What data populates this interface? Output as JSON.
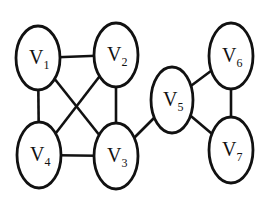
{
  "graph": {
    "type": "undirected",
    "colors": {
      "stroke": "#111111",
      "fill": "#ffffff",
      "background": "#ffffff"
    },
    "nodes": [
      {
        "id": "V1",
        "letter": "V",
        "sub": "1",
        "cx": 38,
        "cy": 58,
        "rx": 22,
        "ry": 32
      },
      {
        "id": "V2",
        "letter": "V",
        "sub": "2",
        "cx": 116,
        "cy": 55,
        "rx": 22,
        "ry": 32
      },
      {
        "id": "V3",
        "letter": "V",
        "sub": "3",
        "cx": 116,
        "cy": 156,
        "rx": 22,
        "ry": 33
      },
      {
        "id": "V4",
        "letter": "V",
        "sub": "4",
        "cx": 39,
        "cy": 155,
        "rx": 22,
        "ry": 33
      },
      {
        "id": "V5",
        "letter": "V",
        "sub": "5",
        "cx": 172,
        "cy": 100,
        "rx": 21,
        "ry": 33
      },
      {
        "id": "V6",
        "letter": "V",
        "sub": "6",
        "cx": 231,
        "cy": 56,
        "rx": 22,
        "ry": 33
      },
      {
        "id": "V7",
        "letter": "V",
        "sub": "7",
        "cx": 231,
        "cy": 150,
        "rx": 22,
        "ry": 33
      }
    ],
    "edges": [
      {
        "from": "V1",
        "to": "V2"
      },
      {
        "from": "V1",
        "to": "V4"
      },
      {
        "from": "V1",
        "to": "V3"
      },
      {
        "from": "V2",
        "to": "V4"
      },
      {
        "from": "V2",
        "to": "V3"
      },
      {
        "from": "V4",
        "to": "V3"
      },
      {
        "from": "V3",
        "to": "V5"
      },
      {
        "from": "V5",
        "to": "V6"
      },
      {
        "from": "V5",
        "to": "V7"
      },
      {
        "from": "V6",
        "to": "V7"
      }
    ]
  }
}
